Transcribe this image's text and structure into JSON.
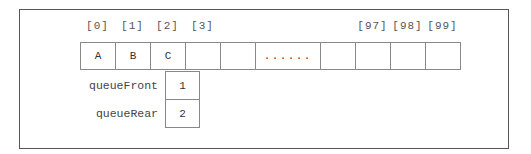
{
  "diagram": {
    "array": {
      "indices": [
        {
          "label": "[0]",
          "x": 80
        },
        {
          "label": "[1]",
          "x": 115
        },
        {
          "label": "[2]",
          "x": 150
        },
        {
          "label": "[3]",
          "x": 185
        },
        {
          "label": "[97]",
          "x": 355
        },
        {
          "label": "[98]",
          "x": 390
        },
        {
          "label": "[99]",
          "x": 425
        }
      ],
      "cells": [
        {
          "value": "A",
          "x": 80,
          "w": 36
        },
        {
          "value": "B",
          "x": 115,
          "w": 36
        },
        {
          "value": "C",
          "x": 150,
          "w": 36
        },
        {
          "value": "",
          "x": 185,
          "w": 36
        },
        {
          "value": "",
          "x": 220,
          "w": 36
        },
        {
          "value": "......",
          "x": 255,
          "w": 66
        },
        {
          "value": "",
          "x": 320,
          "w": 36
        },
        {
          "value": "",
          "x": 355,
          "w": 36
        },
        {
          "value": "",
          "x": 390,
          "w": 36
        },
        {
          "value": "",
          "x": 425,
          "w": 36
        }
      ]
    },
    "pointers": {
      "queueFront": {
        "label": "queueFront",
        "value": "1"
      },
      "queueRear": {
        "label": "queueRear",
        "value": "2"
      }
    }
  }
}
